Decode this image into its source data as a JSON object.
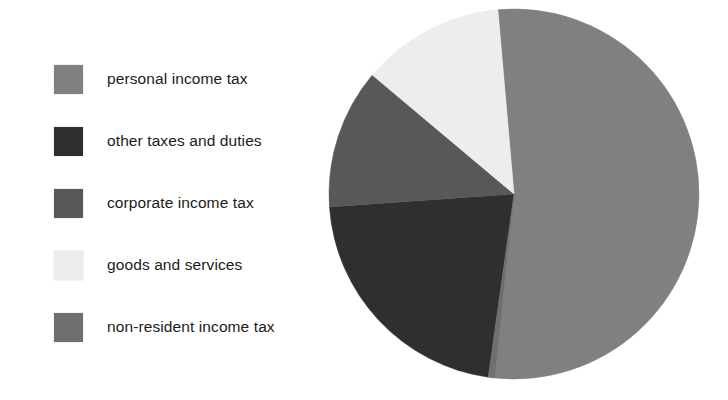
{
  "chart_data": {
    "type": "pie",
    "title": "",
    "subtitle": "",
    "xlabel": "",
    "ylabel": "",
    "grid": false,
    "legend_position": "left",
    "units": "percent of total tax revenue",
    "categories": [
      "personal income tax",
      "other taxes and duties",
      "corporate income tax",
      "goods and services",
      "non-resident income tax"
    ],
    "values": [
      53.0,
      21.7,
      12.2,
      12.6,
      0.5
    ],
    "colors": [
      "#808080",
      "#2f2f2f",
      "#585858",
      "#ededed",
      "#6f6f6f"
    ],
    "slices": [
      {
        "label": "personal income tax",
        "value": 53.0,
        "color": "#808080",
        "start_angle_deg": 355,
        "end_angle_deg": 546
      },
      {
        "label": "other taxes and duties",
        "value": 21.7,
        "color": "#2f2f2f",
        "start_angle_deg": 188,
        "end_angle_deg": 266
      },
      {
        "label": "corporate income tax",
        "value": 12.2,
        "color": "#585858",
        "start_angle_deg": 266,
        "end_angle_deg": 310
      },
      {
        "label": "goods and services",
        "value": 12.6,
        "color": "#ededed",
        "start_angle_deg": 310,
        "end_angle_deg": 355
      },
      {
        "label": "non-resident income tax",
        "value": 0.5,
        "color": "#6f6f6f",
        "start_angle_deg": 186,
        "end_angle_deg": 188
      }
    ],
    "geometry": {
      "center_x": 186,
      "center_y": 186,
      "radius": 185
    }
  },
  "legend": {
    "items": [
      {
        "label": "personal income tax",
        "color": "#808080"
      },
      {
        "label": "other taxes and duties",
        "color": "#2f2f2f"
      },
      {
        "label": "corporate income tax",
        "color": "#585858"
      },
      {
        "label": "goods and services",
        "color": "#ededed"
      },
      {
        "label": "non-resident income tax",
        "color": "#6f6f6f"
      }
    ]
  }
}
